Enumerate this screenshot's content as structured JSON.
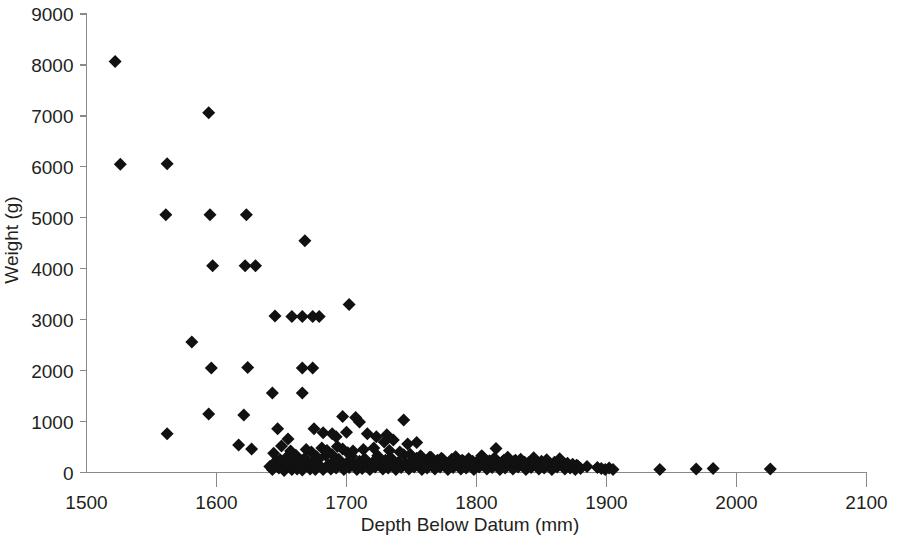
{
  "chart_data": {
    "type": "scatter",
    "title": "",
    "xlabel": "Depth Below Datum (mm)",
    "ylabel": "Weight (g)",
    "xlim": [
      1500,
      2100
    ],
    "ylim": [
      0,
      9000
    ],
    "xticks": [
      1500,
      1600,
      1700,
      1800,
      1900,
      2000,
      2100
    ],
    "yticks": [
      0,
      1000,
      2000,
      3000,
      4000,
      5000,
      6000,
      7000,
      8000,
      9000
    ],
    "xtick_labels": [
      "1500",
      "1600",
      "1700",
      "1800",
      "1900",
      "2000",
      "2100"
    ],
    "ytick_labels": [
      "0",
      "1000",
      "2000",
      "3000",
      "4000",
      "5000",
      "6000",
      "7000",
      "8000",
      "9000"
    ],
    "grid": false,
    "legend": null,
    "marker": "diamond",
    "marker_color": "#111111",
    "marker_size": 13,
    "series": [
      {
        "name": "Weight vs Depth",
        "points": [
          [
            1522,
            8070
          ],
          [
            1526,
            6050
          ],
          [
            1562,
            6060
          ],
          [
            1594,
            7060
          ],
          [
            1561,
            5060
          ],
          [
            1595,
            5060
          ],
          [
            1623,
            5060
          ],
          [
            1668,
            4550
          ],
          [
            1597,
            4060
          ],
          [
            1622,
            4060
          ],
          [
            1630,
            4060
          ],
          [
            1645,
            3070
          ],
          [
            1658,
            3060
          ],
          [
            1666,
            3060
          ],
          [
            1674,
            3060
          ],
          [
            1679,
            3060
          ],
          [
            1702,
            3300
          ],
          [
            1581,
            2560
          ],
          [
            1596,
            2050
          ],
          [
            1624,
            2060
          ],
          [
            1666,
            2050
          ],
          [
            1674,
            2050
          ],
          [
            1643,
            1560
          ],
          [
            1666,
            1560
          ],
          [
            1594,
            1150
          ],
          [
            1621,
            1130
          ],
          [
            1697,
            1100
          ],
          [
            1707,
            1080
          ],
          [
            1744,
            1030
          ],
          [
            1710,
            990
          ],
          [
            1562,
            760
          ],
          [
            1617,
            540
          ],
          [
            1627,
            460
          ],
          [
            1647,
            860
          ],
          [
            1655,
            660
          ],
          [
            1650,
            520
          ],
          [
            1675,
            860
          ],
          [
            1682,
            780
          ],
          [
            1689,
            760
          ],
          [
            1692,
            700
          ],
          [
            1700,
            790
          ],
          [
            1716,
            760
          ],
          [
            1723,
            700
          ],
          [
            1731,
            740
          ],
          [
            1736,
            640
          ],
          [
            1729,
            600
          ],
          [
            1747,
            560
          ],
          [
            1754,
            590
          ],
          [
            1815,
            470
          ],
          [
            1641,
            120
          ],
          [
            1643,
            60
          ],
          [
            1646,
            230
          ],
          [
            1648,
            90
          ],
          [
            1650,
            160
          ],
          [
            1652,
            40
          ],
          [
            1654,
            300
          ],
          [
            1656,
            110
          ],
          [
            1658,
            60
          ],
          [
            1660,
            210
          ],
          [
            1662,
            70
          ],
          [
            1664,
            160
          ],
          [
            1666,
            50
          ],
          [
            1668,
            280
          ],
          [
            1670,
            130
          ],
          [
            1672,
            70
          ],
          [
            1674,
            190
          ],
          [
            1676,
            60
          ],
          [
            1678,
            250
          ],
          [
            1680,
            120
          ],
          [
            1682,
            60
          ],
          [
            1684,
            340
          ],
          [
            1686,
            150
          ],
          [
            1688,
            70
          ],
          [
            1690,
            210
          ],
          [
            1692,
            90
          ],
          [
            1694,
            260
          ],
          [
            1696,
            130
          ],
          [
            1698,
            60
          ],
          [
            1700,
            180
          ],
          [
            1702,
            100
          ],
          [
            1704,
            320
          ],
          [
            1706,
            140
          ],
          [
            1708,
            60
          ],
          [
            1710,
            220
          ],
          [
            1712,
            80
          ],
          [
            1714,
            270
          ],
          [
            1716,
            120
          ],
          [
            1718,
            60
          ],
          [
            1720,
            190
          ],
          [
            1722,
            110
          ],
          [
            1724,
            330
          ],
          [
            1726,
            150
          ],
          [
            1728,
            70
          ],
          [
            1730,
            240
          ],
          [
            1732,
            90
          ],
          [
            1734,
            290
          ],
          [
            1736,
            130
          ],
          [
            1738,
            60
          ],
          [
            1740,
            200
          ],
          [
            1742,
            100
          ],
          [
            1744,
            350
          ],
          [
            1746,
            160
          ],
          [
            1748,
            70
          ],
          [
            1750,
            230
          ],
          [
            1752,
            110
          ],
          [
            1754,
            280
          ],
          [
            1756,
            140
          ],
          [
            1758,
            60
          ],
          [
            1760,
            210
          ],
          [
            1762,
            90
          ],
          [
            1764,
            300
          ],
          [
            1766,
            150
          ],
          [
            1768,
            70
          ],
          [
            1770,
            240
          ],
          [
            1772,
            110
          ],
          [
            1774,
            260
          ],
          [
            1776,
            130
          ],
          [
            1778,
            60
          ],
          [
            1780,
            190
          ],
          [
            1782,
            100
          ],
          [
            1784,
            310
          ],
          [
            1786,
            140
          ],
          [
            1788,
            70
          ],
          [
            1790,
            220
          ],
          [
            1792,
            90
          ],
          [
            1794,
            270
          ],
          [
            1796,
            120
          ],
          [
            1798,
            60
          ],
          [
            1800,
            200
          ],
          [
            1802,
            110
          ],
          [
            1804,
            330
          ],
          [
            1806,
            150
          ],
          [
            1808,
            70
          ],
          [
            1810,
            230
          ],
          [
            1812,
            100
          ],
          [
            1814,
            280
          ],
          [
            1816,
            130
          ],
          [
            1818,
            60
          ],
          [
            1820,
            210
          ],
          [
            1822,
            90
          ],
          [
            1824,
            300
          ],
          [
            1826,
            140
          ],
          [
            1828,
            70
          ],
          [
            1830,
            240
          ],
          [
            1832,
            110
          ],
          [
            1834,
            260
          ],
          [
            1836,
            130
          ],
          [
            1838,
            60
          ],
          [
            1840,
            190
          ],
          [
            1842,
            100
          ],
          [
            1844,
            290
          ],
          [
            1846,
            150
          ],
          [
            1848,
            70
          ],
          [
            1850,
            220
          ],
          [
            1852,
            90
          ],
          [
            1854,
            250
          ],
          [
            1856,
            120
          ],
          [
            1858,
            60
          ],
          [
            1860,
            200
          ],
          [
            1862,
            110
          ],
          [
            1864,
            270
          ],
          [
            1866,
            140
          ],
          [
            1868,
            70
          ],
          [
            1870,
            180
          ],
          [
            1872,
            90
          ],
          [
            1874,
            160
          ],
          [
            1876,
            60
          ],
          [
            1878,
            130
          ],
          [
            1880,
            80
          ],
          [
            1644,
            380
          ],
          [
            1657,
            420
          ],
          [
            1669,
            450
          ],
          [
            1681,
            480
          ],
          [
            1693,
            510
          ],
          [
            1649,
            250
          ],
          [
            1661,
            340
          ],
          [
            1673,
            400
          ],
          [
            1685,
            430
          ],
          [
            1697,
            460
          ],
          [
            1653,
            180
          ],
          [
            1665,
            230
          ],
          [
            1677,
            310
          ],
          [
            1689,
            350
          ],
          [
            1701,
            390
          ],
          [
            1705,
            420
          ],
          [
            1713,
            450
          ],
          [
            1721,
            480
          ],
          [
            1733,
            430
          ],
          [
            1741,
            400
          ],
          [
            1749,
            360
          ],
          [
            1757,
            330
          ],
          [
            1765,
            300
          ],
          [
            1773,
            280
          ],
          [
            1781,
            260
          ],
          [
            1789,
            240
          ],
          [
            1797,
            220
          ],
          [
            1805,
            300
          ],
          [
            1813,
            260
          ],
          [
            1821,
            240
          ],
          [
            1829,
            220
          ],
          [
            1837,
            200
          ],
          [
            1845,
            180
          ],
          [
            1853,
            170
          ],
          [
            1861,
            160
          ],
          [
            1869,
            150
          ],
          [
            1877,
            140
          ],
          [
            1885,
            120
          ],
          [
            1893,
            100
          ],
          [
            1896,
            80
          ],
          [
            1899,
            60
          ],
          [
            1902,
            90
          ],
          [
            1905,
            60
          ],
          [
            1941,
            60
          ],
          [
            1969,
            70
          ],
          [
            1982,
            80
          ],
          [
            2026,
            70
          ]
        ]
      }
    ]
  },
  "axes": {
    "x_axis_name": "depth-axis",
    "y_axis_name": "weight-axis"
  }
}
